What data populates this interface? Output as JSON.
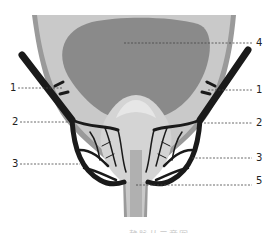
{
  "figure": {
    "type": "anatomical-diagram",
    "colors": {
      "outer_wall": "#c9c9c9",
      "outer_rim": "#9a9a9a",
      "bladder": "#8a8a8a",
      "prostate": "#d4d4d4",
      "vessels": "#1a1a1a",
      "leader_line": "#444444",
      "label_text": "#222222"
    },
    "labels": [
      {
        "id": "left-1",
        "text": "1",
        "side": "left",
        "y": 88
      },
      {
        "id": "left-2",
        "text": "2",
        "side": "left",
        "y": 122
      },
      {
        "id": "left-3",
        "text": "3",
        "side": "left",
        "y": 164
      },
      {
        "id": "right-4",
        "text": "4",
        "side": "right",
        "y": 43
      },
      {
        "id": "right-1",
        "text": "1",
        "side": "right",
        "y": 90
      },
      {
        "id": "right-2",
        "text": "2",
        "side": "right",
        "y": 123
      },
      {
        "id": "right-3",
        "text": "3",
        "side": "right",
        "y": 158
      },
      {
        "id": "right-5",
        "text": "5",
        "side": "right",
        "y": 181
      }
    ],
    "caption": "·· ·· ···· 静脉丛示意图"
  }
}
